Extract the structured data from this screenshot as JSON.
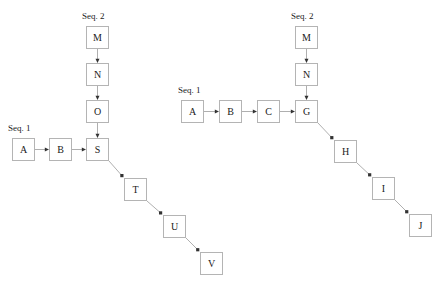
{
  "diagram": {
    "canvas": {
      "width": 442,
      "height": 283,
      "background": "#ffffff"
    },
    "style": {
      "node_border_color": "#b4b4b4",
      "node_fill_color": "#ffffff",
      "node_text_color": "#1a1a1a",
      "edge_color": "#9a9a9a",
      "arrowhead_color": "#333333",
      "label_text_color": "#1a1a1a"
    },
    "labels": [
      {
        "id": "label-left-seq2",
        "text": "Seq. 2",
        "x": 82,
        "y": 11
      },
      {
        "id": "label-left-seq1",
        "text": "Seq. 1",
        "x": 8,
        "y": 123
      },
      {
        "id": "label-right-seq1",
        "text": "Seq. 1",
        "x": 178,
        "y": 85
      },
      {
        "id": "label-right-seq2",
        "text": "Seq. 2",
        "x": 291,
        "y": 11
      }
    ],
    "nodes": [
      {
        "id": "left-M",
        "label": "M",
        "x": 86,
        "y": 26
      },
      {
        "id": "left-N",
        "label": "N",
        "x": 86,
        "y": 63
      },
      {
        "id": "left-O",
        "label": "O",
        "x": 86,
        "y": 100
      },
      {
        "id": "left-S",
        "label": "S",
        "x": 86,
        "y": 138
      },
      {
        "id": "left-A",
        "label": "A",
        "x": 12,
        "y": 138
      },
      {
        "id": "left-B",
        "label": "B",
        "x": 49,
        "y": 138
      },
      {
        "id": "left-T",
        "label": "T",
        "x": 124,
        "y": 178
      },
      {
        "id": "left-U",
        "label": "U",
        "x": 163,
        "y": 215
      },
      {
        "id": "left-V",
        "label": "V",
        "x": 200,
        "y": 252
      },
      {
        "id": "right-M",
        "label": "M",
        "x": 295,
        "y": 26
      },
      {
        "id": "right-N",
        "label": "N",
        "x": 295,
        "y": 63
      },
      {
        "id": "right-G",
        "label": "G",
        "x": 295,
        "y": 100
      },
      {
        "id": "right-A",
        "label": "A",
        "x": 181,
        "y": 100
      },
      {
        "id": "right-B",
        "label": "B",
        "x": 219,
        "y": 100
      },
      {
        "id": "right-C",
        "label": "C",
        "x": 257,
        "y": 100
      },
      {
        "id": "right-H",
        "label": "H",
        "x": 334,
        "y": 140
      },
      {
        "id": "right-I",
        "label": "I",
        "x": 372,
        "y": 177
      },
      {
        "id": "right-J",
        "label": "J",
        "x": 409,
        "y": 214
      }
    ],
    "edges": [
      {
        "id": "edge-left-M-N",
        "from": "left-M",
        "to": "left-N",
        "orientation": "vertical"
      },
      {
        "id": "edge-left-N-O",
        "from": "left-N",
        "to": "left-O",
        "orientation": "vertical"
      },
      {
        "id": "edge-left-O-S",
        "from": "left-O",
        "to": "left-S",
        "orientation": "vertical"
      },
      {
        "id": "edge-left-A-B",
        "from": "left-A",
        "to": "left-B",
        "orientation": "horizontal"
      },
      {
        "id": "edge-left-B-S",
        "from": "left-B",
        "to": "left-S",
        "orientation": "horizontal"
      },
      {
        "id": "edge-left-S-T",
        "from": "left-S",
        "to": "left-T",
        "orientation": "diagonal"
      },
      {
        "id": "edge-left-T-U",
        "from": "left-T",
        "to": "left-U",
        "orientation": "diagonal"
      },
      {
        "id": "edge-left-U-V",
        "from": "left-U",
        "to": "left-V",
        "orientation": "diagonal"
      },
      {
        "id": "edge-right-M-N",
        "from": "right-M",
        "to": "right-N",
        "orientation": "vertical"
      },
      {
        "id": "edge-right-N-G",
        "from": "right-N",
        "to": "right-G",
        "orientation": "vertical"
      },
      {
        "id": "edge-right-A-B",
        "from": "right-A",
        "to": "right-B",
        "orientation": "horizontal"
      },
      {
        "id": "edge-right-B-C",
        "from": "right-B",
        "to": "right-C",
        "orientation": "horizontal"
      },
      {
        "id": "edge-right-C-G",
        "from": "right-C",
        "to": "right-G",
        "orientation": "horizontal"
      },
      {
        "id": "edge-right-G-H",
        "from": "right-G",
        "to": "right-H",
        "orientation": "diagonal"
      },
      {
        "id": "edge-right-H-I",
        "from": "right-H",
        "to": "right-I",
        "orientation": "diagonal"
      },
      {
        "id": "edge-right-I-J",
        "from": "right-I",
        "to": "right-J",
        "orientation": "diagonal"
      }
    ]
  }
}
